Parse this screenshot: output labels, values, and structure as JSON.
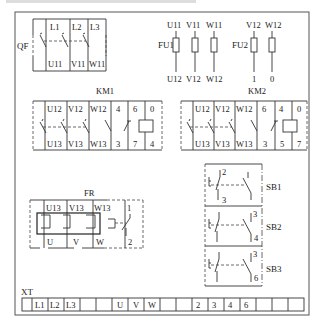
{
  "figure": {
    "qf": {
      "label": "QF",
      "top_terminals": [
        "L1",
        "L2",
        "L3"
      ],
      "bottom_terminals": [
        "U11",
        "V11",
        "W11"
      ]
    },
    "fu1": {
      "label": "FU1",
      "top_terminals": [
        "U11",
        "V11",
        "W11"
      ],
      "bottom_terminals": [
        "U12",
        "V12",
        "W12"
      ]
    },
    "fu2": {
      "label": "FU2",
      "top_terminals": [
        "V12",
        "W12"
      ],
      "bottom_terminals": [
        "1",
        "0"
      ]
    },
    "km1": {
      "label": "KM1",
      "top_terminals": [
        "U12",
        "V12",
        "W12",
        "4",
        "6",
        "0"
      ],
      "bottom_terminals": [
        "U13",
        "V13",
        "W13",
        "3",
        "7",
        "4"
      ]
    },
    "km2": {
      "label": "KM2",
      "top_terminals": [
        "U12",
        "V12",
        "W12",
        "6",
        "4",
        "0"
      ],
      "bottom_terminals": [
        "U13",
        "V13",
        "W13",
        "3",
        "5",
        "7"
      ]
    },
    "fr": {
      "label": "FR",
      "top_terminals": [
        "U13",
        "V13",
        "W13",
        "1"
      ],
      "bottom_terminals": [
        "U",
        "V",
        "W",
        "2"
      ]
    },
    "sb1": {
      "label": "SB1",
      "top_terminal": "2",
      "bottom_terminal": "3"
    },
    "sb2": {
      "label": "SB2",
      "top_terminal": "3",
      "bottom_terminal": "4"
    },
    "sb3": {
      "label": "SB3",
      "top_terminal": "3",
      "bottom_terminal": "6"
    },
    "xt": {
      "label": "XT",
      "cells": [
        "",
        "L1",
        "L2",
        "L3",
        "",
        "",
        "U",
        "V",
        "W",
        "",
        "",
        "2",
        "3",
        "4",
        "6",
        "",
        "",
        ""
      ]
    }
  },
  "colors": {
    "line": "#333333",
    "background": "#ffffff"
  }
}
